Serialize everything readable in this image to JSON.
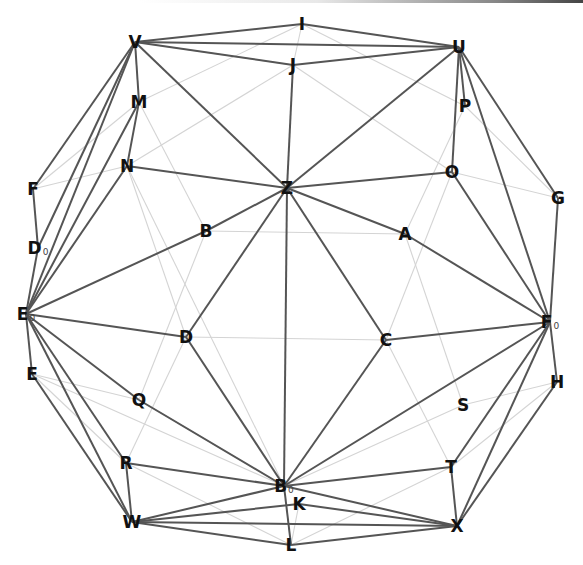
{
  "diagram": {
    "type": "graph",
    "nodes": [
      {
        "id": "I",
        "label": "I",
        "sub": "",
        "x": 302,
        "y": 24
      },
      {
        "id": "V",
        "label": "V",
        "sub": "",
        "x": 135,
        "y": 42
      },
      {
        "id": "J",
        "label": "J",
        "sub": "",
        "x": 293,
        "y": 65
      },
      {
        "id": "U",
        "label": "U",
        "sub": "",
        "x": 459,
        "y": 47
      },
      {
        "id": "M",
        "label": "M",
        "sub": "",
        "x": 139,
        "y": 102
      },
      {
        "id": "P",
        "label": "P",
        "sub": "",
        "x": 465,
        "y": 106
      },
      {
        "id": "N",
        "label": "N",
        "sub": "",
        "x": 127,
        "y": 166
      },
      {
        "id": "Z",
        "label": "Z",
        "sub": "",
        "x": 287,
        "y": 188
      },
      {
        "id": "O",
        "label": "O",
        "sub": "",
        "x": 452,
        "y": 172
      },
      {
        "id": "F",
        "label": "F",
        "sub": "",
        "x": 33,
        "y": 189
      },
      {
        "id": "G",
        "label": "G",
        "sub": "",
        "x": 558,
        "y": 198
      },
      {
        "id": "B",
        "label": "B",
        "sub": "",
        "x": 206,
        "y": 231
      },
      {
        "id": "A",
        "label": "A",
        "sub": "",
        "x": 405,
        "y": 234
      },
      {
        "id": "D0",
        "label": "D",
        "sub": "0",
        "x": 38,
        "y": 248
      },
      {
        "id": "E0",
        "label": "E",
        "sub": "0",
        "x": 26,
        "y": 314
      },
      {
        "id": "F0",
        "label": "F",
        "sub": "0",
        "x": 550,
        "y": 322
      },
      {
        "id": "D",
        "label": "D",
        "sub": "",
        "x": 186,
        "y": 337
      },
      {
        "id": "C",
        "label": "C",
        "sub": "",
        "x": 386,
        "y": 340
      },
      {
        "id": "E",
        "label": "E",
        "sub": "",
        "x": 32,
        "y": 374
      },
      {
        "id": "H",
        "label": "H",
        "sub": "",
        "x": 557,
        "y": 382
      },
      {
        "id": "Q",
        "label": "Q",
        "sub": "",
        "x": 139,
        "y": 400
      },
      {
        "id": "S",
        "label": "S",
        "sub": "",
        "x": 463,
        "y": 405
      },
      {
        "id": "R",
        "label": "R",
        "sub": "",
        "x": 126,
        "y": 463
      },
      {
        "id": "T",
        "label": "T",
        "sub": "",
        "x": 451,
        "y": 467
      },
      {
        "id": "B0",
        "label": "B",
        "sub": "0",
        "x": 284,
        "y": 486
      },
      {
        "id": "K",
        "label": "K",
        "sub": "",
        "x": 299,
        "y": 504
      },
      {
        "id": "W",
        "label": "W",
        "sub": "",
        "x": 132,
        "y": 522
      },
      {
        "id": "X",
        "label": "X",
        "sub": "",
        "x": 457,
        "y": 526
      },
      {
        "id": "L",
        "label": "L",
        "sub": "",
        "x": 291,
        "y": 545
      }
    ],
    "edges_dark": [
      [
        "V",
        "I"
      ],
      [
        "V",
        "U"
      ],
      [
        "V",
        "J"
      ],
      [
        "V",
        "Z"
      ],
      [
        "V",
        "M"
      ],
      [
        "V",
        "F"
      ],
      [
        "V",
        "D0"
      ],
      [
        "V",
        "E0"
      ],
      [
        "I",
        "U"
      ],
      [
        "J",
        "U"
      ],
      [
        "J",
        "Z"
      ],
      [
        "U",
        "Z"
      ],
      [
        "U",
        "P"
      ],
      [
        "U",
        "O"
      ],
      [
        "U",
        "G"
      ],
      [
        "U",
        "F0"
      ],
      [
        "M",
        "N"
      ],
      [
        "M",
        "E0"
      ],
      [
        "N",
        "Z"
      ],
      [
        "N",
        "E0"
      ],
      [
        "Z",
        "O"
      ],
      [
        "Z",
        "B"
      ],
      [
        "Z",
        "A"
      ],
      [
        "Z",
        "D"
      ],
      [
        "Z",
        "C"
      ],
      [
        "Z",
        "B0"
      ],
      [
        "B",
        "E0"
      ],
      [
        "A",
        "F0"
      ],
      [
        "O",
        "F0"
      ],
      [
        "G",
        "F0"
      ],
      [
        "F",
        "D0"
      ],
      [
        "D0",
        "E0"
      ],
      [
        "E0",
        "E"
      ],
      [
        "E0",
        "D"
      ],
      [
        "E0",
        "Q"
      ],
      [
        "E0",
        "R"
      ],
      [
        "E0",
        "W"
      ],
      [
        "E",
        "W"
      ],
      [
        "D",
        "B0"
      ],
      [
        "Q",
        "B0"
      ],
      [
        "C",
        "F0"
      ],
      [
        "C",
        "B0"
      ],
      [
        "F0",
        "H"
      ],
      [
        "F0",
        "B0"
      ],
      [
        "F0",
        "T"
      ],
      [
        "F0",
        "X"
      ],
      [
        "H",
        "X"
      ],
      [
        "R",
        "B0"
      ],
      [
        "R",
        "W"
      ],
      [
        "W",
        "B0"
      ],
      [
        "W",
        "K"
      ],
      [
        "W",
        "X"
      ],
      [
        "W",
        "L"
      ],
      [
        "B0",
        "T"
      ],
      [
        "B0",
        "X"
      ],
      [
        "B0",
        "L"
      ],
      [
        "K",
        "X"
      ],
      [
        "T",
        "X"
      ],
      [
        "L",
        "X"
      ]
    ],
    "edges_light": [
      [
        "V",
        "J"
      ],
      [
        "I",
        "M"
      ],
      [
        "I",
        "J"
      ],
      [
        "I",
        "P"
      ],
      [
        "J",
        "N"
      ],
      [
        "J",
        "O"
      ],
      [
        "P",
        "G"
      ],
      [
        "P",
        "A"
      ],
      [
        "M",
        "B"
      ],
      [
        "F",
        "N"
      ],
      [
        "F",
        "M"
      ],
      [
        "N",
        "D"
      ],
      [
        "N",
        "B0"
      ],
      [
        "O",
        "G"
      ],
      [
        "O",
        "C"
      ],
      [
        "B",
        "A"
      ],
      [
        "B",
        "Q"
      ],
      [
        "A",
        "S"
      ],
      [
        "D",
        "C"
      ],
      [
        "D",
        "R"
      ],
      [
        "C",
        "T"
      ],
      [
        "E",
        "Q"
      ],
      [
        "E",
        "R"
      ],
      [
        "E",
        "B0"
      ],
      [
        "S",
        "H"
      ],
      [
        "S",
        "B0"
      ],
      [
        "H",
        "T"
      ],
      [
        "T",
        "L"
      ],
      [
        "R",
        "L"
      ],
      [
        "Q",
        "B0"
      ],
      [
        "K",
        "L"
      ]
    ]
  }
}
